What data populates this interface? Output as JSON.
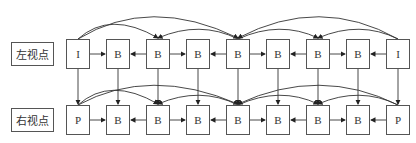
{
  "labels": {
    "left_view": "左视点",
    "right_view": "右视点"
  },
  "top_row": [
    "I",
    "B",
    "B",
    "B",
    "B",
    "B",
    "B",
    "B",
    "I"
  ],
  "bottom_row": [
    "P",
    "B",
    "B",
    "B",
    "B",
    "B",
    "B",
    "B",
    "P"
  ]
}
